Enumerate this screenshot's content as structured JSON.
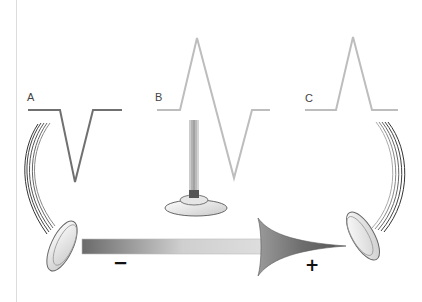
{
  "diagram": {
    "colors": {
      "waveform_a": "#707070",
      "waveform_b": "#bdbdbd",
      "waveform_c": "#bdbdbd",
      "arrow_dark": "#5a5a5a",
      "arrow_light": "#d8d8d8",
      "border_line": "#d9d9d9"
    },
    "panels": [
      {
        "id": "A",
        "label": "A",
        "deflection": "negative",
        "electrode": "left, curved lead"
      },
      {
        "id": "B",
        "label": "B",
        "deflection": "biphasic",
        "electrode": "center, vertical lead"
      },
      {
        "id": "C",
        "label": "C",
        "deflection": "positive",
        "electrode": "right, curved lead"
      }
    ],
    "arrow": {
      "direction": "left-to-right",
      "negative_label": "−",
      "positive_label": "+"
    }
  }
}
